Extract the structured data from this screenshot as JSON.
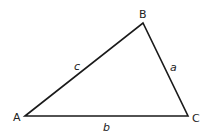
{
  "diagram": {
    "type": "triangle",
    "vertices": [
      {
        "id": "A",
        "label": "A",
        "x": 25,
        "y": 116
      },
      {
        "id": "B",
        "label": "B",
        "x": 143,
        "y": 23
      },
      {
        "id": "C",
        "label": "C",
        "x": 188,
        "y": 116
      }
    ],
    "sides": [
      {
        "id": "a",
        "label": "a",
        "from": "B",
        "to": "C"
      },
      {
        "id": "b",
        "label": "b",
        "from": "A",
        "to": "C"
      },
      {
        "id": "c",
        "label": "c",
        "from": "A",
        "to": "B"
      }
    ],
    "stroke_color": "#1a1a1a"
  }
}
